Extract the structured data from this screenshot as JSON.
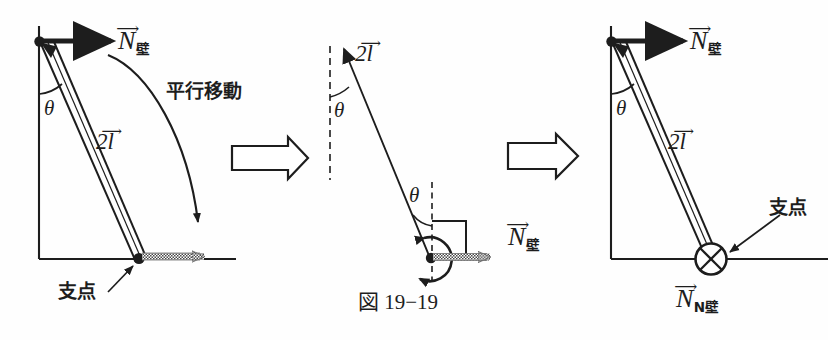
{
  "figure": {
    "caption": "図 19−19",
    "background_color": "#fefefe",
    "ink_color": "#1d1d1d",
    "hatch_color": "#6b6b6b"
  },
  "panels": [
    {
      "id": "panel-left",
      "name": "original-configuration",
      "labels": {
        "wall_normal": "N",
        "wall_normal_sub": "壁",
        "rod_length": "2l",
        "angle": "θ",
        "fulcrum": "支点",
        "annotation": "平行移動"
      }
    },
    {
      "id": "panel-middle",
      "name": "translated-vector-detail",
      "labels": {
        "rod_length": "2l",
        "angle_top": "θ",
        "angle_bottom": "θ",
        "wall_normal": "N",
        "wall_normal_sub": "壁"
      }
    },
    {
      "id": "panel-right",
      "name": "resulting-configuration",
      "labels": {
        "wall_normal": "N",
        "wall_normal_sub": "壁",
        "rod_length": "2l",
        "angle": "θ",
        "fulcrum": "支点",
        "moment_label": "N",
        "moment_sub": "N壁"
      }
    }
  ],
  "symbols": {
    "vector_accent": "⟶",
    "arrow_accent_small": "→",
    "into_page": "⊗",
    "block_arrow": "⇒"
  },
  "transitions": [
    {
      "id": "transition-1",
      "name": "arrow-left-to-middle",
      "glyph": "⇒"
    },
    {
      "id": "transition-2",
      "name": "arrow-middle-to-right",
      "glyph": "⇒"
    }
  ]
}
